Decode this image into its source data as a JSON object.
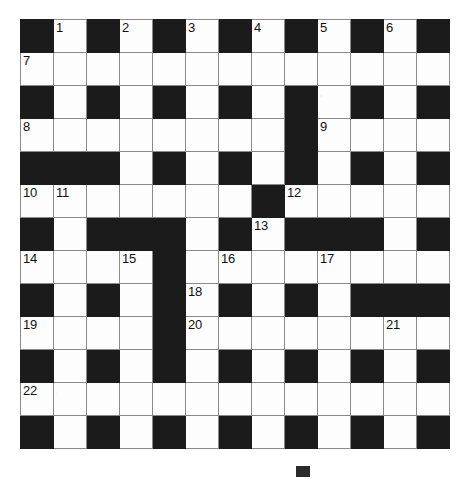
{
  "puzzle": {
    "type": "crossword-grid",
    "title": "Crossword puzzle grid",
    "rows": 13,
    "cols": 13,
    "cell_size_px": 33,
    "colors": {
      "block": "#1b1b1b",
      "cell": "#fdfdfd",
      "grid_line": "#8a8a8a",
      "number": "#111111",
      "page": "#ffffff"
    },
    "legend": {
      "block_char": "#",
      "open_char": "."
    },
    "grid": [
      "#.#.#.#.#.#.#",
      ".............",
      "#.#.#.#.#.#.#",
      "........#....",
      "###.#.#.#.#.#",
      ".......#.....",
      "#.###.#.###.#",
      "....#........",
      "#.#.#.#.#.###",
      "....#........",
      "#.#.#.#.#.#.#",
      ".............",
      "#.#.#.#.#.#.#"
    ],
    "numbers": [
      {
        "n": "1",
        "row": 0,
        "col": 1
      },
      {
        "n": "2",
        "row": 0,
        "col": 3
      },
      {
        "n": "3",
        "row": 0,
        "col": 5
      },
      {
        "n": "4",
        "row": 0,
        "col": 7
      },
      {
        "n": "5",
        "row": 0,
        "col": 9
      },
      {
        "n": "6",
        "row": 0,
        "col": 11
      },
      {
        "n": "7",
        "row": 1,
        "col": 0
      },
      {
        "n": "8",
        "row": 3,
        "col": 0
      },
      {
        "n": "9",
        "row": 3,
        "col": 9
      },
      {
        "n": "10",
        "row": 5,
        "col": 0
      },
      {
        "n": "11",
        "row": 5,
        "col": 1
      },
      {
        "n": "12",
        "row": 5,
        "col": 8
      },
      {
        "n": "13",
        "row": 6,
        "col": 7
      },
      {
        "n": "14",
        "row": 7,
        "col": 0
      },
      {
        "n": "15",
        "row": 7,
        "col": 3
      },
      {
        "n": "16",
        "row": 7,
        "col": 6
      },
      {
        "n": "17",
        "row": 7,
        "col": 9
      },
      {
        "n": "18",
        "row": 8,
        "col": 5
      },
      {
        "n": "19",
        "row": 9,
        "col": 0
      },
      {
        "n": "20",
        "row": 9,
        "col": 5
      },
      {
        "n": "21",
        "row": 9,
        "col": 11
      },
      {
        "n": "22",
        "row": 11,
        "col": 0
      }
    ]
  }
}
